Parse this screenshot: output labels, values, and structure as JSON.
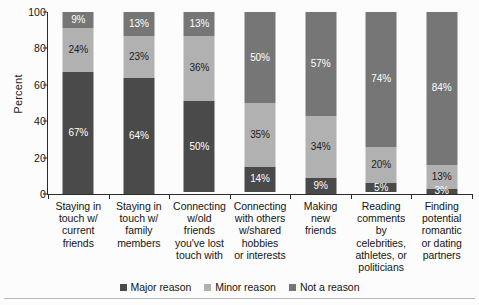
{
  "chart_data": {
    "type": "bar",
    "subtype": "stacked-bar-100",
    "title": "",
    "xlabel": "",
    "ylabel": "Percent",
    "ylim": [
      0,
      100
    ],
    "yticks": [
      0,
      20,
      40,
      60,
      80,
      100
    ],
    "ytick_labels": [
      "0",
      "20",
      "40",
      "60",
      "80",
      "100"
    ],
    "grid": false,
    "legend_position": "bottom-center",
    "categories": [
      "Staying in touch w/ current friends",
      "Staying in touch w/ family members",
      "Connecting w/old friends you've lost touch with",
      "Connecting with others w/shared hobbies or interests",
      "Making new friends",
      "Reading comments by celebrities, athletes, or politicians",
      "Finding potential romantic or dating partners"
    ],
    "category_lines": [
      [
        "Staying in",
        "touch w/",
        "current",
        "friends"
      ],
      [
        "Staying in",
        "touch w/",
        "family",
        "members"
      ],
      [
        "Connecting",
        "w/old",
        "friends",
        "you've lost",
        "touch with"
      ],
      [
        "Connecting",
        "with others",
        "w/shared",
        "hobbies",
        "or interests"
      ],
      [
        "Making",
        "new",
        "friends"
      ],
      [
        "Reading",
        "comments by",
        "celebrities,",
        "athletes, or",
        "politicians"
      ],
      [
        "Finding",
        "potential",
        "romantic",
        "or dating",
        "partners"
      ]
    ],
    "series": [
      {
        "name": "Major reason",
        "color": "#4a4a4a",
        "values": [
          67,
          64,
          50,
          14,
          9,
          5,
          3
        ],
        "labels": [
          "67%",
          "64%",
          "50%",
          "14%",
          "9%",
          "5%",
          "3%"
        ]
      },
      {
        "name": "Minor reason",
        "color": "#b1b1b1",
        "values": [
          24,
          23,
          36,
          35,
          34,
          20,
          13
        ],
        "labels": [
          "24%",
          "23%",
          "36%",
          "35%",
          "34%",
          "20%",
          "13%"
        ]
      },
      {
        "name": "Not a reason",
        "color": "#767676",
        "values": [
          9,
          13,
          13,
          50,
          57,
          74,
          84
        ],
        "labels": [
          "9%",
          "13%",
          "13%",
          "50%",
          "57%",
          "74%",
          "84%"
        ]
      }
    ],
    "stack_order_top_to_bottom": [
      "Not a reason",
      "Minor reason",
      "Major reason"
    ]
  }
}
